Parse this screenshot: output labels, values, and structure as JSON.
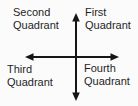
{
  "diagram": {
    "quadrant_labels": {
      "second": [
        "Second",
        "Quadrant"
      ],
      "first": [
        "First",
        "Quadrant"
      ],
      "third": [
        "Third",
        "Quadrant"
      ],
      "fourth": [
        "Fourth",
        "Quadrant"
      ]
    },
    "axes": {
      "x_axis": "horizontal double-arrow",
      "y_axis": "vertical double-arrow"
    },
    "colors": {
      "line": "#161616",
      "text": "#1f1f1f",
      "background": "#fbfbfb"
    }
  }
}
